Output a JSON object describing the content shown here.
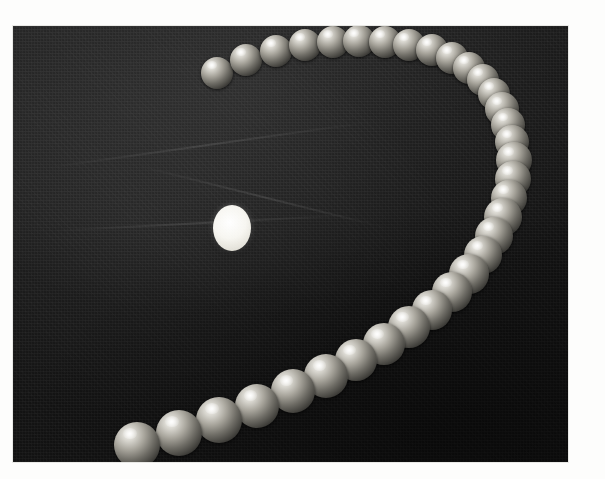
{
  "page": {
    "background_color": "#fdfdfc",
    "width": 605,
    "height": 479
  },
  "photo": {
    "name": "stroboscopic-trajectory-photograph",
    "caption": "",
    "frame": {
      "left": 13,
      "top": 26,
      "width": 555,
      "height": 436
    },
    "backdrop_color": "#141414",
    "subject": "sphere in flight recorded as a multiple-exposure strobe sequence",
    "marker": {
      "label": "reference-marker",
      "color": "#ffffff",
      "cx": 232,
      "cy": 228,
      "rx": 19,
      "ry": 23
    },
    "ball_color_highlight": "#f4f3ef",
    "ball_color_shadow": "#1c1b19",
    "exposure_count": 32,
    "balls": [
      {
        "cx": 217,
        "cy": 73,
        "r": 16
      },
      {
        "cx": 246,
        "cy": 60,
        "r": 16
      },
      {
        "cx": 276,
        "cy": 51,
        "r": 16
      },
      {
        "cx": 305,
        "cy": 45,
        "r": 16
      },
      {
        "cx": 333,
        "cy": 42,
        "r": 16
      },
      {
        "cx": 359,
        "cy": 41,
        "r": 16
      },
      {
        "cx": 385,
        "cy": 42,
        "r": 16
      },
      {
        "cx": 409,
        "cy": 45,
        "r": 16
      },
      {
        "cx": 432,
        "cy": 50,
        "r": 16
      },
      {
        "cx": 452,
        "cy": 58,
        "r": 16
      },
      {
        "cx": 469,
        "cy": 68,
        "r": 16
      },
      {
        "cx": 483,
        "cy": 80,
        "r": 16
      },
      {
        "cx": 494,
        "cy": 94,
        "r": 16
      },
      {
        "cx": 502,
        "cy": 109,
        "r": 17
      },
      {
        "cx": 508,
        "cy": 125,
        "r": 17
      },
      {
        "cx": 512,
        "cy": 142,
        "r": 17
      },
      {
        "cx": 514,
        "cy": 160,
        "r": 18
      },
      {
        "cx": 513,
        "cy": 179,
        "r": 18
      },
      {
        "cx": 509,
        "cy": 198,
        "r": 18
      },
      {
        "cx": 503,
        "cy": 217,
        "r": 19
      },
      {
        "cx": 494,
        "cy": 236,
        "r": 19
      },
      {
        "cx": 483,
        "cy": 255,
        "r": 19
      },
      {
        "cx": 469,
        "cy": 274,
        "r": 20
      },
      {
        "cx": 452,
        "cy": 292,
        "r": 20
      },
      {
        "cx": 432,
        "cy": 310,
        "r": 20
      },
      {
        "cx": 409,
        "cy": 327,
        "r": 21
      },
      {
        "cx": 384,
        "cy": 344,
        "r": 21
      },
      {
        "cx": 356,
        "cy": 360,
        "r": 21
      },
      {
        "cx": 326,
        "cy": 376,
        "r": 22
      },
      {
        "cx": 293,
        "cy": 391,
        "r": 22
      },
      {
        "cx": 257,
        "cy": 406,
        "r": 22
      },
      {
        "cx": 219,
        "cy": 420,
        "r": 23
      },
      {
        "cx": 179,
        "cy": 433,
        "r": 23
      },
      {
        "cx": 137,
        "cy": 445,
        "r": 23
      }
    ],
    "creases": [
      {
        "left": 30,
        "top": 118,
        "width": 330,
        "height": 2,
        "rotate": -8
      },
      {
        "left": 40,
        "top": 196,
        "width": 300,
        "height": 2,
        "rotate": -3
      },
      {
        "left": 120,
        "top": 170,
        "width": 260,
        "height": 2,
        "rotate": 14
      }
    ]
  },
  "margin": {
    "note_1": "",
    "note_2": ""
  }
}
